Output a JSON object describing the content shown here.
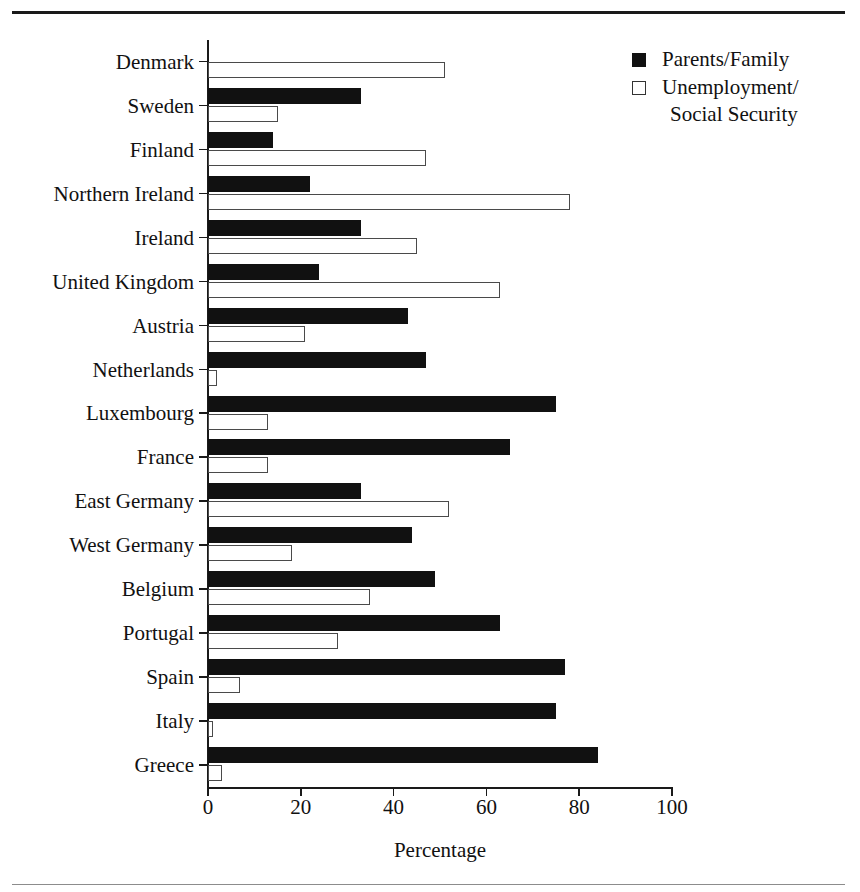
{
  "chart_data": {
    "type": "bar",
    "orientation": "horizontal",
    "title": "",
    "xlabel": "Percentage",
    "ylabel": "",
    "xlim": [
      0,
      100
    ],
    "xticks": [
      0,
      20,
      40,
      60,
      80,
      100
    ],
    "xticklabels": [
      "0",
      "20",
      "40",
      "60",
      "80",
      "100"
    ],
    "grid": false,
    "legend_position": "top-right",
    "categories": [
      "Denmark",
      "Sweden",
      "Finland",
      "Northern Ireland",
      "Ireland",
      "United Kingdom",
      "Austria",
      "Netherlands",
      "Luxembourg",
      "France",
      "East Germany",
      "West Germany",
      "Belgium",
      "Portugal",
      "Spain",
      "Italy",
      "Greece"
    ],
    "series": [
      {
        "name": "Parents/Family",
        "color": "#111111",
        "values": [
          0,
          33,
          14,
          22,
          33,
          24,
          43,
          47,
          75,
          65,
          33,
          44,
          49,
          63,
          77,
          75,
          84
        ]
      },
      {
        "name": "Unemployment/Social Security",
        "color": "#ffffff",
        "values": [
          51,
          15,
          47,
          78,
          45,
          63,
          21,
          2,
          13,
          13,
          52,
          18,
          35,
          28,
          7,
          1,
          3
        ]
      }
    ]
  },
  "legend": {
    "items": [
      {
        "label": "Parents/Family",
        "label_cont": "",
        "swatch": "filled-square-icon"
      },
      {
        "label": "Unemployment/",
        "label_cont": "Social Security",
        "swatch": "open-square-icon"
      }
    ]
  },
  "axis": {
    "x_title": "Percentage"
  }
}
